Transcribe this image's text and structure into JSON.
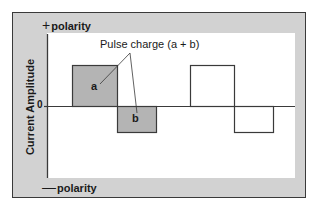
{
  "diagram": {
    "title": "Pulse charge (a + b)",
    "y_axis_label": "Current Amplitude",
    "zero_label": "0",
    "top_label": {
      "sign": "+",
      "text": "polarity"
    },
    "bottom_label": {
      "sign": "—",
      "text": "polarity"
    },
    "segment_labels": {
      "a": "a",
      "b": "b"
    },
    "colors": {
      "frame_fill": "#d2d2d2",
      "panel_fill": "#ffffff",
      "shaded_pulse": "#b4b4b4",
      "line": "#3a3a3a"
    },
    "pulses": [
      {
        "name": "pulse-1-positive",
        "phase": "positive",
        "shaded": true,
        "label": "a"
      },
      {
        "name": "pulse-1-negative",
        "phase": "negative",
        "shaded": true,
        "label": "b"
      },
      {
        "name": "pulse-2-positive",
        "phase": "positive",
        "shaded": false
      },
      {
        "name": "pulse-2-negative",
        "phase": "negative",
        "shaded": false
      }
    ]
  }
}
